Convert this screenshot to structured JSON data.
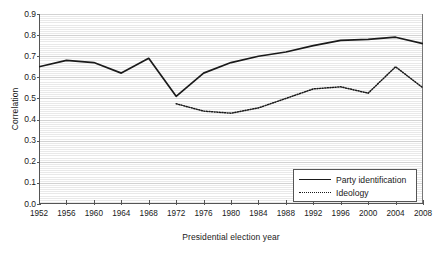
{
  "chart_data": {
    "type": "line",
    "title": "",
    "xlabel": "Presidential election year",
    "ylabel": "Correlation",
    "x": [
      1952,
      1956,
      1960,
      1964,
      1968,
      1972,
      1976,
      1980,
      1984,
      1988,
      1992,
      1996,
      2000,
      2004,
      2008
    ],
    "categories": [
      "1952",
      "1956",
      "1960",
      "1964",
      "1968",
      "1972",
      "1976",
      "1980",
      "1984",
      "1988",
      "1992",
      "1996",
      "2000",
      "2004",
      "2008"
    ],
    "xlim": [
      1952,
      2008
    ],
    "ylim": [
      0.0,
      0.9
    ],
    "yticks": [
      "0.9",
      "0.8",
      "0.7",
      "0.6",
      "0.5",
      "0.4",
      "0.3",
      "0.2",
      "0.1",
      "0.0"
    ],
    "ytick_values": [
      0.9,
      0.8,
      0.7,
      0.6,
      0.5,
      0.4,
      0.3,
      0.2,
      0.1,
      0.0
    ],
    "grid": "horizontal-dense",
    "legend_position": "bottom-right",
    "series": [
      {
        "name": "Party identification",
        "style": "solid",
        "color": "#1a1a1a",
        "x": [
          1952,
          1956,
          1960,
          1964,
          1968,
          1972,
          1976,
          1980,
          1984,
          1988,
          1992,
          1996,
          2000,
          2004,
          2008
        ],
        "values": [
          0.65,
          0.68,
          0.67,
          0.62,
          0.69,
          0.51,
          0.62,
          0.67,
          0.7,
          0.72,
          0.75,
          0.775,
          0.78,
          0.79,
          0.76
        ]
      },
      {
        "name": "Ideology",
        "style": "dotted",
        "color": "#1a1a1a",
        "x": [
          1972,
          1976,
          1980,
          1984,
          1988,
          1992,
          1996,
          2000,
          2004,
          2008
        ],
        "values": [
          0.475,
          0.44,
          0.43,
          0.455,
          0.5,
          0.545,
          0.555,
          0.525,
          0.65,
          0.55
        ]
      }
    ]
  },
  "legend": {
    "items": [
      {
        "label": "Party identification",
        "style": "solid"
      },
      {
        "label": "Ideology",
        "style": "dotted"
      }
    ]
  }
}
